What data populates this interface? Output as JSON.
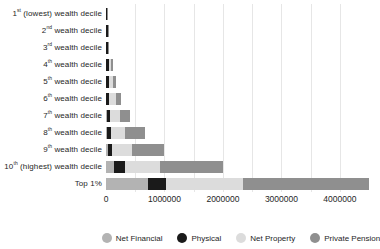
{
  "chart_data": {
    "type": "bar",
    "orientation": "horizontal-stacked",
    "title": "",
    "xlabel": "",
    "ylabel": "",
    "grid": true,
    "legend_position": "bottom",
    "categories": [
      {
        "num": "1",
        "sup": "st",
        "rest": " (lowest) wealth decile",
        "text": "1st (lowest) wealth decile"
      },
      {
        "num": "2",
        "sup": "nd",
        "rest": " wealth decile",
        "text": "2nd wealth decile"
      },
      {
        "num": "3",
        "sup": "rd",
        "rest": " wealth decile",
        "text": "3rd wealth decile"
      },
      {
        "num": "4",
        "sup": "th",
        "rest": " wealth decile",
        "text": "4th wealth decile"
      },
      {
        "num": "5",
        "sup": "th",
        "rest": " wealth decile",
        "text": "5th wealth decile"
      },
      {
        "num": "6",
        "sup": "th",
        "rest": " wealth decile",
        "text": "6th wealth decile"
      },
      {
        "num": "7",
        "sup": "th",
        "rest": " wealth decile",
        "text": "7th wealth decile"
      },
      {
        "num": "8",
        "sup": "th",
        "rest": " wealth decile",
        "text": "8th wealth decile"
      },
      {
        "num": "9",
        "sup": "th",
        "rest": " wealth decile",
        "text": "9th wealth decile"
      },
      {
        "num": "10",
        "sup": "th",
        "rest": " (highest) wealth decile",
        "text": "10th (highest) wealth decile"
      },
      {
        "num": "",
        "sup": "",
        "rest": "Top 1%",
        "text": "Top 1%"
      }
    ],
    "series": [
      {
        "name": "Net Financial",
        "color": "#b3b3b3",
        "values": [
          1000,
          2000,
          3000,
          5000,
          6000,
          8000,
          15000,
          20000,
          40000,
          140000,
          720000
        ]
      },
      {
        "name": "Physical",
        "color": "#1a1a1a",
        "values": [
          13000,
          24000,
          38000,
          50000,
          50000,
          52000,
          58000,
          60000,
          70000,
          180000,
          300000
        ]
      },
      {
        "name": "Net Property",
        "color": "#dcdcdc",
        "values": [
          0,
          0,
          0,
          30000,
          58000,
          110000,
          160000,
          250000,
          340000,
          600000,
          1330000
        ]
      },
      {
        "name": "Private Pension",
        "color": "#8f8f8f",
        "values": [
          6000,
          9000,
          14000,
          38000,
          52000,
          90000,
          180000,
          340000,
          550000,
          1080000,
          2140000
        ]
      }
    ],
    "x_axis": {
      "max": 4600000,
      "tick_labels": [
        "0",
        "1000000",
        "2000000",
        "3000000",
        "4000000"
      ],
      "tick_values": [
        0,
        1000000,
        2000000,
        3000000,
        4000000
      ],
      "gridline_step": 500000,
      "gridline_color": "#e6e6e6"
    },
    "legend": [
      "Net Financial",
      "Physical",
      "Net Property",
      "Private Pension"
    ]
  }
}
